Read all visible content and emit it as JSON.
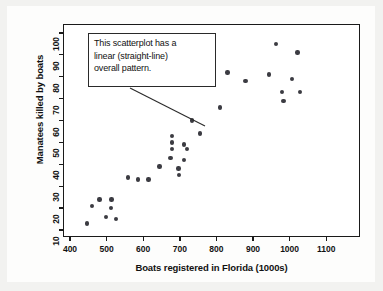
{
  "figure": {
    "background_color": "#f2f2f0",
    "plot_background_color": "#ffffff",
    "point_color": "#3b3b42",
    "axis_color": "#1a1a1a"
  },
  "annotation": {
    "name": "linear-pattern-callout",
    "lines": [
      "This scatterplot has a",
      "linear (straight-line)",
      "overall pattern."
    ],
    "full_text": "This scatterplot has a linear (straight-line) overall pattern.",
    "leader_line": {
      "from_x": 130,
      "from_y": 88,
      "to_x": 205,
      "to_y": 126
    }
  },
  "chart_data": {
    "type": "scatter",
    "title": "",
    "xlabel": "Boats registered in Florida (1000s)",
    "ylabel": "Manatees killed by boats",
    "xlim": [
      370,
      1140
    ],
    "ylim": [
      7,
      103
    ],
    "xticks": [
      400,
      500,
      600,
      700,
      800,
      900,
      1000,
      1100
    ],
    "yticks": [
      10,
      20,
      30,
      40,
      50,
      60,
      70,
      80,
      90,
      100
    ],
    "grid": false,
    "legend": false,
    "series": [
      {
        "name": "Manatee deaths vs boats registered",
        "marker": "circle",
        "color": "#3b3b42",
        "points": [
          {
            "x": 447,
            "y": 13
          },
          {
            "x": 460,
            "y": 21
          },
          {
            "x": 481,
            "y": 24
          },
          {
            "x": 498,
            "y": 16
          },
          {
            "x": 513,
            "y": 24
          },
          {
            "x": 512,
            "y": 20
          },
          {
            "x": 526,
            "y": 15
          },
          {
            "x": 559,
            "y": 34
          },
          {
            "x": 585,
            "y": 33
          },
          {
            "x": 614,
            "y": 33
          },
          {
            "x": 645,
            "y": 39
          },
          {
            "x": 675,
            "y": 43
          },
          {
            "x": 679,
            "y": 50
          },
          {
            "x": 678,
            "y": 47
          },
          {
            "x": 678,
            "y": 53
          },
          {
            "x": 696,
            "y": 38
          },
          {
            "x": 697,
            "y": 35
          },
          {
            "x": 711,
            "y": 49
          },
          {
            "x": 712,
            "y": 42
          },
          {
            "x": 719,
            "y": 47
          },
          {
            "x": 733,
            "y": 60
          },
          {
            "x": 755,
            "y": 54
          },
          {
            "x": 809,
            "y": 66
          },
          {
            "x": 830,
            "y": 82
          },
          {
            "x": 880,
            "y": 78
          },
          {
            "x": 944,
            "y": 81
          },
          {
            "x": 962,
            "y": 95
          },
          {
            "x": 980,
            "y": 73
          },
          {
            "x": 983,
            "y": 69
          },
          {
            "x": 1006,
            "y": 79
          },
          {
            "x": 1022,
            "y": 91
          },
          {
            "x": 1028,
            "y": 73
          }
        ]
      }
    ]
  }
}
